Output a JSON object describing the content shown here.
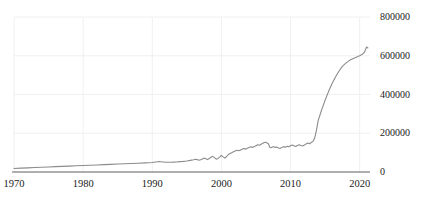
{
  "chart_data": {
    "type": "line",
    "title": "",
    "xlabel": "",
    "ylabel": "",
    "xlim": [
      1970,
      2021.5
    ],
    "ylim": [
      0,
      800000
    ],
    "grid": true,
    "legend": null,
    "line_color": "#8c8c8c",
    "axis_color": "#555555",
    "grid_color": "#f0f0f0",
    "text_color": "#1a1a1a",
    "xticks": [
      1970,
      1980,
      1990,
      2000,
      2010,
      2020
    ],
    "xtick_labels": [
      "1970",
      "1980",
      "1990",
      "2000",
      "2010",
      "2020"
    ],
    "yticks": [
      0,
      200000,
      400000,
      600000,
      800000
    ],
    "ytick_labels": [
      "0",
      "200000",
      "400000",
      "600000",
      "800000"
    ],
    "ytick_side": "right",
    "series": [
      {
        "name": "value",
        "x": [
          1970.0,
          1971.0,
          1972.0,
          1973.0,
          1974.0,
          1975.0,
          1976.0,
          1977.0,
          1978.0,
          1979.0,
          1980.0,
          1981.0,
          1982.0,
          1983.0,
          1984.0,
          1985.0,
          1986.0,
          1987.0,
          1988.0,
          1989.0,
          1990.0,
          1990.5,
          1991.0,
          1991.5,
          1992.0,
          1992.5,
          1993.0,
          1993.5,
          1994.0,
          1994.5,
          1995.0,
          1995.5,
          1996.0,
          1996.25,
          1996.5,
          1996.75,
          1997.0,
          1997.25,
          1997.5,
          1997.75,
          1998.0,
          1998.25,
          1998.5,
          1998.75,
          1999.0,
          1999.25,
          1999.5,
          1999.75,
          2000.0,
          2000.25,
          2000.5,
          2000.75,
          2001.0,
          2001.25,
          2001.5,
          2001.75,
          2002.0,
          2002.25,
          2002.5,
          2002.75,
          2003.0,
          2003.25,
          2003.5,
          2003.75,
          2004.0,
          2004.25,
          2004.5,
          2004.75,
          2005.0,
          2005.25,
          2005.5,
          2005.75,
          2006.0,
          2006.2,
          2006.4,
          2006.6,
          2006.8,
          2007.0,
          2007.25,
          2007.5,
          2007.75,
          2008.0,
          2008.25,
          2008.5,
          2008.75,
          2009.0,
          2009.25,
          2009.5,
          2009.75,
          2010.0,
          2010.25,
          2010.5,
          2010.75,
          2011.0,
          2011.25,
          2011.5,
          2011.75,
          2012.0,
          2012.25,
          2012.5,
          2012.75,
          2013.0,
          2013.25,
          2013.5,
          2013.75,
          2014.0,
          2014.5,
          2015.0,
          2015.5,
          2016.0,
          2016.5,
          2017.0,
          2017.5,
          2018.0,
          2018.5,
          2019.0,
          2019.5,
          2020.0,
          2020.4,
          2020.7,
          2021.0,
          2021.2
        ],
        "values": [
          18000,
          20000,
          21500,
          23000,
          24500,
          26000,
          27500,
          29000,
          30500,
          32000,
          33500,
          35000,
          36500,
          38000,
          39500,
          41000,
          42500,
          44000,
          45500,
          47000,
          49000,
          52000,
          54000,
          52000,
          50000,
          50500,
          51000,
          52000,
          53500,
          55000,
          57000,
          60000,
          63000,
          66000,
          64000,
          61000,
          63000,
          67000,
          72000,
          68000,
          64000,
          70000,
          76000,
          81000,
          74000,
          66000,
          70000,
          77000,
          86000,
          78000,
          72000,
          80000,
          90000,
          96000,
          100000,
          104000,
          108000,
          112000,
          110000,
          113000,
          117000,
          121000,
          118000,
          122000,
          126000,
          130000,
          127000,
          131000,
          136000,
          141000,
          138000,
          143000,
          148000,
          152000,
          154000,
          150000,
          146000,
          128000,
          126000,
          131000,
          127000,
          129000,
          124000,
          122000,
          126000,
          131000,
          128000,
          133000,
          130000,
          135000,
          139000,
          135000,
          132000,
          137000,
          141000,
          137000,
          134000,
          139000,
          145000,
          150000,
          146000,
          152000,
          158000,
          175000,
          215000,
          265000,
          320000,
          370000,
          415000,
          455000,
          490000,
          520000,
          545000,
          562000,
          575000,
          585000,
          592000,
          600000,
          608000,
          618000,
          645000,
          640000
        ]
      }
    ]
  }
}
